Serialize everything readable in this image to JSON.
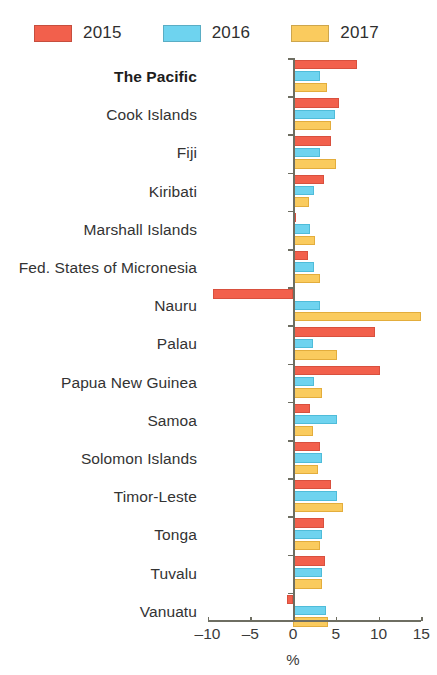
{
  "legend": {
    "items": [
      {
        "label": "2015",
        "color": "#f2604c",
        "key": "y2015"
      },
      {
        "label": "2016",
        "color": "#6ed3ef",
        "key": "y2016"
      },
      {
        "label": "2017",
        "color": "#facb5e",
        "key": "y2017"
      }
    ]
  },
  "axis": {
    "title": "%",
    "ticks": [
      -10,
      -5,
      0,
      5,
      10,
      15
    ],
    "tick_labels": [
      "–10",
      "–5",
      "0",
      "5",
      "10",
      "15"
    ],
    "min": -10,
    "max": 15
  },
  "chart_data": {
    "type": "bar",
    "orientation": "horizontal",
    "grouped": true,
    "title": "",
    "subtitle": "",
    "xlabel": "%",
    "ylabel": "",
    "xlim": [
      -10,
      15
    ],
    "grid": false,
    "legend_position": "top-left",
    "categories": [
      "The Pacific",
      "Cook Islands",
      "Fiji",
      "Kiribati",
      "Marshall Islands",
      "Fed. States of Micronesia",
      "Nauru",
      "Palau",
      "Papua New Guinea",
      "Samoa",
      "Solomon Islands",
      "Timor-Leste",
      "Tonga",
      "Tuvalu",
      "Vanuatu"
    ],
    "highlight_category": "The Pacific",
    "series": [
      {
        "name": "2015",
        "color": "#f2604c",
        "values": [
          7.5,
          5.4,
          4.5,
          3.6,
          0.4,
          1.8,
          -9.3,
          9.6,
          10.2,
          2.0,
          3.1,
          4.4,
          3.6,
          3.7,
          -0.7
        ]
      },
      {
        "name": "2016",
        "color": "#6ed3ef",
        "values": [
          3.2,
          4.9,
          3.2,
          2.4,
          2.0,
          2.4,
          3.2,
          2.3,
          2.5,
          5.1,
          3.4,
          5.2,
          3.4,
          3.4,
          3.9
        ]
      },
      {
        "name": "2017",
        "color": "#facb5e",
        "values": [
          4.0,
          4.5,
          5.0,
          1.9,
          2.6,
          3.1,
          15.0,
          5.1,
          3.4,
          2.3,
          2.9,
          5.8,
          3.1,
          3.4,
          4.1
        ]
      }
    ]
  }
}
